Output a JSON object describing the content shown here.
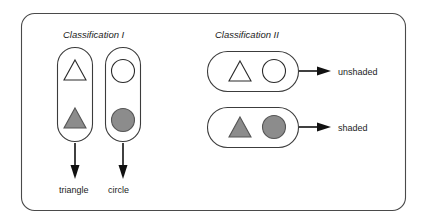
{
  "figure": {
    "headings": [
      {
        "id": "classification-1",
        "text": "Classification I",
        "x": 63,
        "y": 38
      },
      {
        "id": "classification-2",
        "text": "Classification II",
        "x": 215,
        "y": 38
      }
    ],
    "outcome_labels": [
      {
        "id": "unshaded",
        "text": "unshaded",
        "x": 338,
        "y": 71
      },
      {
        "id": "shaded",
        "text": "shaded",
        "x": 338,
        "y": 127
      }
    ],
    "category_labels": [
      {
        "id": "triangle",
        "text": "triangle",
        "x": 59,
        "y": 190
      },
      {
        "id": "circle",
        "text": "circle",
        "x": 108,
        "y": 190
      }
    ],
    "groups": [
      {
        "id": "group-triangle-column",
        "orientation": "vertical",
        "classification": "Classification I",
        "members": [
          "triangle-unshaded",
          "triangle-shaded"
        ]
      },
      {
        "id": "group-circle-column",
        "orientation": "vertical",
        "classification": "Classification I",
        "members": [
          "circle-unshaded",
          "circle-shaded"
        ]
      },
      {
        "id": "group-unshaded-row",
        "orientation": "horizontal",
        "classification": "Classification II",
        "members": [
          "triangle-unshaded",
          "circle-unshaded"
        ]
      },
      {
        "id": "group-shaded-row",
        "orientation": "horizontal",
        "classification": "Classification II",
        "members": [
          "triangle-shaded",
          "circle-shaded"
        ]
      }
    ],
    "colors": {
      "fill_shaded": "#8c8c8c",
      "fill_unshaded": "#ffffff",
      "stroke": "#2b2b2b",
      "frame_stroke": "#4a4a4a",
      "arrow": "#111111",
      "background": "#ffffff"
    }
  }
}
